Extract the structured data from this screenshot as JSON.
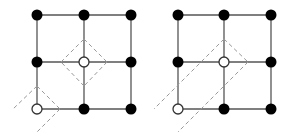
{
  "diagram": {
    "colors": {
      "edge": "#555555",
      "node_filled": "#000000",
      "node_hollow_fill": "#ffffff",
      "node_hollow_stroke": "#333333",
      "dashed": "#999999"
    },
    "panels": [
      {
        "name": "left-lattice",
        "grid_x": [
          37,
          84,
          131
        ],
        "grid_y": [
          15,
          62,
          109
        ],
        "hollow_nodes": [
          [
            1,
            1
          ],
          [
            0,
            2
          ]
        ],
        "dashed_segments": [
          [
            84,
            39,
            107,
            62
          ],
          [
            107,
            62,
            84,
            86
          ],
          [
            84,
            86,
            61,
            62
          ],
          [
            61,
            62,
            84,
            39
          ],
          [
            37,
            86,
            13,
            109
          ],
          [
            37,
            86,
            60,
            109
          ],
          [
            60,
            109,
            37,
            132
          ]
        ]
      },
      {
        "name": "right-lattice",
        "grid_x": [
          178,
          224,
          271
        ],
        "grid_y": [
          15,
          62,
          109
        ],
        "hollow_nodes": [
          [
            1,
            1
          ],
          [
            0,
            2
          ]
        ],
        "dashed_segments": [
          [
            224,
            39,
            248,
            62
          ],
          [
            224,
            39,
            154,
            109
          ],
          [
            248,
            62,
            178,
            132
          ]
        ]
      }
    ]
  }
}
